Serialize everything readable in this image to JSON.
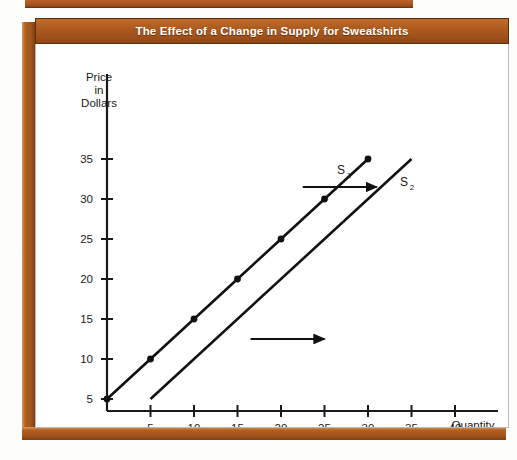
{
  "figure": {
    "title": "The Effect of a Change in Supply for Sweatshirts",
    "frame_color": "#a8541f",
    "title_text_color": "#ffffff",
    "panel_color": "#ffffff"
  },
  "chart_data": {
    "type": "line",
    "title": "The Effect of a Change in Supply for Sweatshirts",
    "xlabel": "Quantity",
    "ylabel": "Price in Dollars",
    "ylabel_lines": [
      "Price",
      "in",
      "Dollars"
    ],
    "xlim": [
      0,
      42
    ],
    "ylim": [
      0,
      37
    ],
    "grid": false,
    "legend": "inline-labels",
    "xticks": [
      5,
      10,
      15,
      20,
      25,
      30,
      35,
      40
    ],
    "yticks": [
      5,
      10,
      15,
      20,
      25,
      30,
      35
    ],
    "series": [
      {
        "name": "S1",
        "label": "S",
        "sublabel": "1",
        "line_color": "#111111",
        "markers": true,
        "x": [
          0,
          5,
          10,
          15,
          20,
          25,
          30
        ],
        "y": [
          5,
          10,
          15,
          20,
          25,
          30,
          35
        ]
      },
      {
        "name": "S2",
        "label": "S",
        "sublabel": "2",
        "line_color": "#111111",
        "markers": false,
        "x": [
          5,
          35
        ],
        "y": [
          5,
          35
        ]
      }
    ],
    "annotations": [
      {
        "name": "shift-arrow-upper",
        "kind": "arrow",
        "direction": "right",
        "from": [
          22.5,
          31.5
        ],
        "to": [
          31,
          31.5
        ]
      },
      {
        "name": "shift-arrow-lower",
        "kind": "arrow",
        "direction": "right",
        "from": [
          16.5,
          12.5
        ],
        "to": [
          25,
          12.5
        ]
      }
    ]
  }
}
